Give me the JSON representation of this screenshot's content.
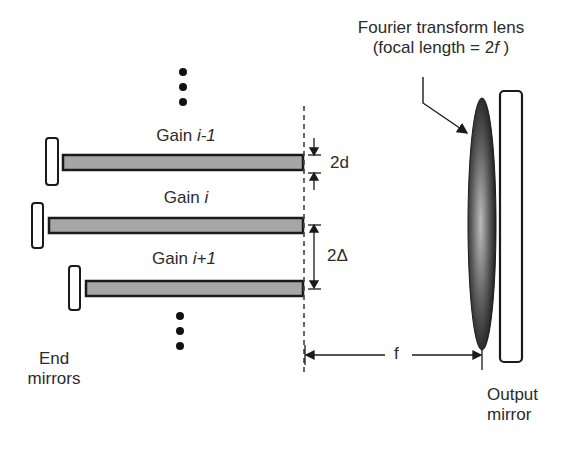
{
  "diagram": {
    "gains": [
      {
        "prefix": "Gain",
        "index": "i-1"
      },
      {
        "prefix": "Gain",
        "index": "i"
      },
      {
        "prefix": "Gain",
        "index": "i+1"
      }
    ],
    "lens_label_line1": "Fourier transform lens",
    "lens_label_line2_prefix": "(focal length = 2",
    "lens_label_line2_var": "f",
    "lens_label_line2_suffix": " )",
    "spacing_d_label": "2d",
    "spacing_delta_label": "2Δ",
    "focal_label": "f",
    "end_mirrors_line1": "End",
    "end_mirrors_line2": "mirrors",
    "output_mirror_line1": "Output",
    "output_mirror_line2": "mirror",
    "colors": {
      "gain_fill": "#a6a6a6",
      "outline": "#1a1a1a",
      "lens_dark": "#141414",
      "lens_light": "#b5b5b5"
    }
  }
}
